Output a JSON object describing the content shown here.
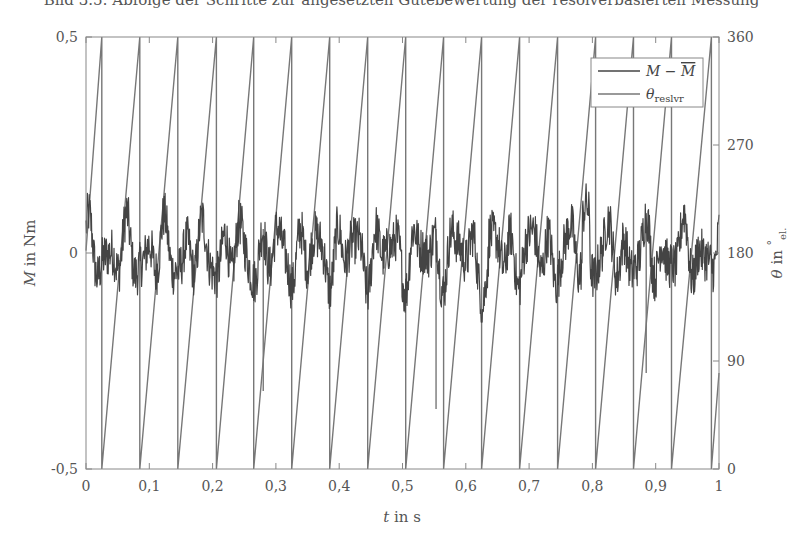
{
  "caption": "Bild 3.5: Abfolge der Schritte zur angesetzten Gütebewertung der resolverbasierten Messung",
  "chart_data": {
    "type": "line",
    "title": "",
    "xlabel": "t in s",
    "ylabel": "M in Nm",
    "ylabel_right": "θ in °el.",
    "xlim": [
      0,
      1
    ],
    "ylim": [
      -0.5,
      0.5
    ],
    "ylim_right": [
      0,
      360
    ],
    "xticks": [
      "0",
      "0,1",
      "0,2",
      "0,3",
      "0,4",
      "0,5",
      "0,6",
      "0,7",
      "0,8",
      "0,9",
      "1"
    ],
    "yticks_left": [
      "-0,5",
      "0",
      "0,5"
    ],
    "yticks_right": [
      "0",
      "90",
      "180",
      "270",
      "360"
    ],
    "grid": false,
    "legend_position": "upper right",
    "series": [
      {
        "name": "M − M̄",
        "axis": "left",
        "description": "Torque ripple noise around 0 Nm, amplitude roughly ±0.1 Nm, peak ≈ +0.15 Nm near t≈0.79 s",
        "amplitude_approx": 0.1,
        "color": "#444444"
      },
      {
        "name": "θ_reslvr",
        "axis": "right",
        "description": "Sawtooth electrical angle 0–360°, period ≈ 0.06 s (≈17 cycles over 1 s); start ≈ 180° at t=0; glitches near t≈0.28 s, 0.56 s, 0.89 s",
        "period_s": 0.06,
        "wrap_times_s": [
          0.025,
          0.085,
          0.145,
          0.206,
          0.265,
          0.325,
          0.385,
          0.445,
          0.505,
          0.565,
          0.625,
          0.685,
          0.745,
          0.805,
          0.865,
          0.925,
          0.988
        ],
        "start_deg": 182,
        "end_deg": 80,
        "glitches": [
          {
            "t": 0.28,
            "deg": 65
          },
          {
            "t": 0.553,
            "deg": 50
          },
          {
            "t": 0.885,
            "deg": 80
          }
        ],
        "color": "#777777"
      }
    ]
  },
  "legend": {
    "items": [
      {
        "label_main": "M − ",
        "label_bar": "M"
      },
      {
        "label_main": "θ",
        "label_sub": "reslvr"
      }
    ]
  }
}
